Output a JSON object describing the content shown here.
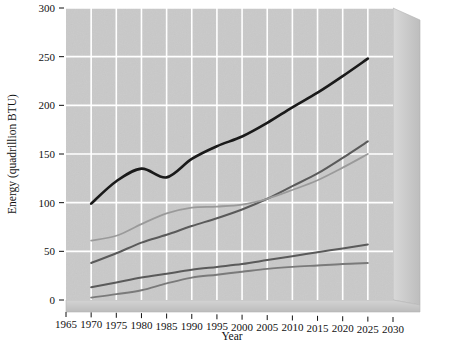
{
  "chart_data": {
    "type": "line",
    "title": "",
    "xlabel": "Year",
    "ylabel": "Energy (quadrillion BTU)",
    "xlim": [
      1965,
      2030
    ],
    "ylim": [
      0,
      300
    ],
    "xticks": [
      1965,
      1970,
      1975,
      1980,
      1985,
      1990,
      1995,
      2000,
      2005,
      2010,
      2015,
      2020,
      2025,
      2030
    ],
    "yticks": [
      0,
      50,
      100,
      150,
      200,
      250,
      300
    ],
    "xtick_labels": [
      "1965",
      "1970",
      "1975",
      "1980",
      "1985",
      "1990",
      "1995",
      "2000",
      "2005",
      "2010",
      "2015",
      "2020",
      "2025",
      "2030"
    ],
    "ytick_labels": [
      "0",
      "50",
      "100",
      "150",
      "200",
      "250",
      "300"
    ],
    "grid": true,
    "legend": "none",
    "style": "3d-wall-gray-background",
    "plot_background": "#c9c9c9",
    "gridline_color": "#ffffff",
    "x": [
      1970,
      1975,
      1980,
      1985,
      1990,
      1995,
      2000,
      2005,
      2010,
      2015,
      2020,
      2025
    ],
    "series": [
      {
        "name": "total-energy",
        "color": "#1a1a1a",
        "width": 2.6,
        "values": [
          99,
          122,
          135,
          126,
          145,
          158,
          168,
          182,
          198,
          213,
          230,
          248
        ]
      },
      {
        "name": "series-2",
        "color": "#5a5a5a",
        "width": 2.0,
        "values": [
          38,
          48,
          59,
          67,
          76,
          84,
          93,
          104,
          117,
          130,
          146,
          163
        ]
      },
      {
        "name": "series-3",
        "color": "#9a9a9a",
        "width": 1.8,
        "values": [
          61,
          66,
          78,
          89,
          95,
          96,
          98,
          104,
          113,
          123,
          136,
          150
        ]
      },
      {
        "name": "series-4",
        "color": "#5a5a5a",
        "width": 2.0,
        "values": [
          13,
          18,
          23,
          27,
          31,
          34,
          37,
          41,
          45,
          49,
          53,
          57
        ]
      },
      {
        "name": "series-5",
        "color": "#7a7a7a",
        "width": 1.9,
        "values": [
          2.5,
          6,
          10,
          17,
          23,
          26,
          29,
          32,
          34,
          35.5,
          37,
          38
        ]
      }
    ]
  }
}
